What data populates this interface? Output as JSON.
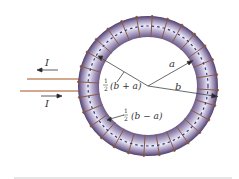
{
  "figure": {
    "current_label_top": "I",
    "current_label_bottom": "I",
    "radius_inner_label": "a",
    "radius_outer_label": "b",
    "mean_radius_label": {
      "frac_num": "1",
      "frac_den": "2",
      "expr": "(b + a)"
    },
    "half_width_label": {
      "frac_num": "1",
      "frac_den": "2",
      "expr": "(b − a)"
    }
  },
  "colors": {
    "torus_dark": "#5a4a78",
    "torus_mid": "#a89cc0",
    "torus_light": "#eeeaf5",
    "winding": "#8a5a48",
    "wire": "#d2a88e",
    "dashed_axis": "#2a3a8a",
    "rule": "#e6e6e6"
  }
}
